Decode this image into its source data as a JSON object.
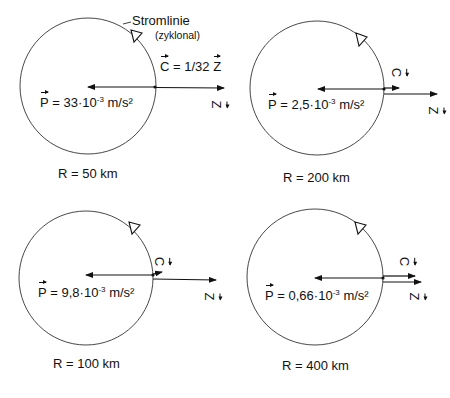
{
  "diagram": {
    "annotation": {
      "streamline_label": "Stromlinie",
      "streamline_type": "(zyklonal)",
      "ratio_label": "= 1/32"
    },
    "symbols": {
      "pressure": "P",
      "coriolis": "C",
      "centrifugal": "Z",
      "equals": "=",
      "times_ten": "·10",
      "exponent": "-3",
      "unit": "m/s²",
      "radius_prefix": "R ="
    },
    "panels": [
      {
        "id": "r50",
        "radius": "50 km",
        "pressure_value": "33",
        "C_length": "1/32 Z",
        "position": "top-left"
      },
      {
        "id": "r200",
        "radius": "200 km",
        "pressure_value": "2,5",
        "C_length": "short",
        "position": "top-right"
      },
      {
        "id": "r100",
        "radius": "100 km",
        "pressure_value": "9,8",
        "C_length": "short",
        "position": "bottom-left"
      },
      {
        "id": "r400",
        "radius": "400 km",
        "pressure_value": "0,66",
        "C_length": "long",
        "position": "bottom-right"
      }
    ],
    "colors": {
      "line": "#111111",
      "background": "#ffffff"
    }
  }
}
